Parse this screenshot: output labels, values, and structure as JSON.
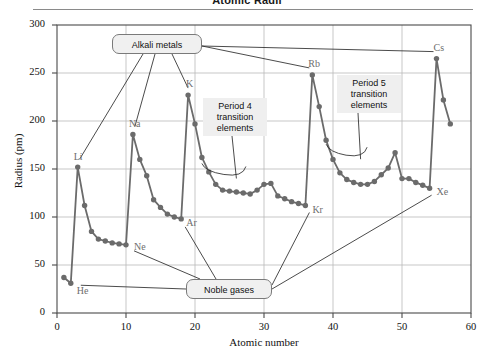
{
  "figure": {
    "title": "Atomic Radii"
  },
  "chart_data": {
    "type": "line",
    "title": "Atomic Radii",
    "xlabel": "Atomic number",
    "ylabel": "Radius (pm)",
    "xlim": [
      0,
      60
    ],
    "ylim": [
      0,
      300
    ],
    "xticks": [
      0,
      10,
      20,
      30,
      40,
      50,
      60
    ],
    "yticks": [
      0,
      50,
      100,
      150,
      200,
      250,
      300
    ],
    "grid": true,
    "legend": "none",
    "marker": "filled-circle",
    "series_color": "#6b6b6b",
    "series": [
      {
        "name": "Atomic radius",
        "x": [
          1,
          2,
          3,
          4,
          5,
          6,
          7,
          8,
          9,
          10,
          11,
          12,
          13,
          14,
          15,
          16,
          17,
          18,
          19,
          20,
          21,
          22,
          23,
          24,
          25,
          26,
          27,
          28,
          29,
          30,
          31,
          32,
          33,
          34,
          35,
          36,
          37,
          38,
          39,
          40,
          41,
          42,
          43,
          44,
          45,
          46,
          47,
          48,
          49,
          50,
          51,
          52,
          53,
          54,
          55,
          56,
          57
        ],
        "values": [
          37,
          31,
          152,
          112,
          85,
          77,
          75,
          73,
          72,
          71,
          186,
          160,
          143,
          118,
          110,
          103,
          100,
          98,
          227,
          197,
          162,
          147,
          134,
          128,
          127,
          126,
          125,
          124,
          128,
          134,
          135,
          122,
          119,
          116,
          114,
          112,
          248,
          215,
          180,
          160,
          146,
          139,
          136,
          134,
          134,
          137,
          144,
          151,
          167,
          140,
          140,
          136,
          133,
          130,
          265,
          222,
          197
        ],
        "labels": [
          "H",
          "He",
          "Li",
          "Be",
          "B",
          "C",
          "N",
          "O",
          "F",
          "Ne",
          "Na",
          "Mg",
          "Al",
          "Si",
          "P",
          "S",
          "Cl",
          "Ar",
          "K",
          "Ca",
          "Sc",
          "Ti",
          "V",
          "Cr",
          "Mn",
          "Fe",
          "Co",
          "Ni",
          "Cu",
          "Zn",
          "Ga",
          "Ge",
          "As",
          "Se",
          "Br",
          "Kr",
          "Rb",
          "Sr",
          "Y",
          "Zr",
          "Nb",
          "Mo",
          "Tc",
          "Ru",
          "Rh",
          "Pd",
          "Ag",
          "Cd",
          "In",
          "Sn",
          "Sb",
          "Te",
          "I",
          "Xe",
          "Cs",
          "Ba",
          "La"
        ]
      }
    ],
    "point_labels": [
      {
        "text": "He",
        "x": 2,
        "y": 31
      },
      {
        "text": "Li",
        "x": 3,
        "y": 152
      },
      {
        "text": "Ne",
        "x": 10,
        "y": 71
      },
      {
        "text": "Na",
        "x": 11,
        "y": 186
      },
      {
        "text": "Ar",
        "x": 18,
        "y": 98
      },
      {
        "text": "K",
        "x": 19,
        "y": 227
      },
      {
        "text": "Kr",
        "x": 36,
        "y": 112
      },
      {
        "text": "Rb",
        "x": 37,
        "y": 248
      },
      {
        "text": "Xe",
        "x": 54,
        "y": 130
      },
      {
        "text": "Cs",
        "x": 55,
        "y": 265
      }
    ],
    "annotations": [
      {
        "id": "alkali-metals",
        "text": "Alkali metals"
      },
      {
        "id": "noble-gases",
        "text": "Noble gases"
      },
      {
        "id": "period-4",
        "text": "Period 4\ntransition\nelements"
      },
      {
        "id": "period-5",
        "text": "Period 5\ntransition\nelements"
      }
    ]
  },
  "annotations": {
    "alkali_metals": "Alkali metals",
    "noble_gases": "Noble gases",
    "period4_line1": "Period 4",
    "period4_line2": "transition",
    "period4_line3": "elements",
    "period5_line1": "Period 5",
    "period5_line2": "transition",
    "period5_line3": "elements"
  }
}
